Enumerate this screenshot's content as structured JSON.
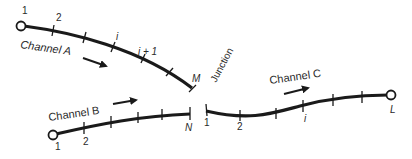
{
  "diagram": {
    "junction_label": "Junction",
    "channels": [
      {
        "id": "A",
        "label": "Channel A",
        "start_node_label": "1",
        "node_labels": [
          "1",
          "2",
          "i",
          "i + 1",
          "M"
        ],
        "end_label": "M",
        "flow_direction": "toward junction"
      },
      {
        "id": "B",
        "label": "Channel B",
        "node_labels": [
          "1",
          "2",
          "N"
        ],
        "end_label": "N",
        "flow_direction": "toward junction"
      },
      {
        "id": "C",
        "label": "Channel C",
        "node_labels": [
          "1",
          "2",
          "i",
          "L"
        ],
        "end_label": "L",
        "flow_direction": "away from junction"
      }
    ],
    "colors": {
      "line": "#1a1a1a",
      "text": "#2a2a2a",
      "background": "#ffffff"
    }
  },
  "labels": {
    "a_1": "1",
    "a_2": "2",
    "a_i": "i",
    "a_i1": "i + 1",
    "a_m": "M",
    "a_name": "Channel A",
    "b_1": "1",
    "b_2": "2",
    "b_n": "N",
    "b_name": "Channel B",
    "c_1": "1",
    "c_2": "2",
    "c_i": "i",
    "c_l": "L",
    "c_name": "Channel C",
    "junction": "Junction"
  }
}
